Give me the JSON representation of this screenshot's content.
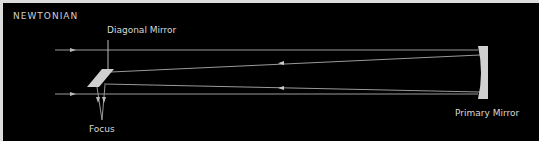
{
  "title": "NEWTONIAN",
  "labels": {
    "diagonal_mirror": "Diagonal Mirror",
    "primary_mirror": "Primary Mirror",
    "focus": "Focus"
  },
  "colors": {
    "background": "#000000",
    "ray": "#9a9a9a",
    "mirror": "#d0d0d0",
    "text": "#d8d8d8",
    "border": "#dcdcdc"
  }
}
